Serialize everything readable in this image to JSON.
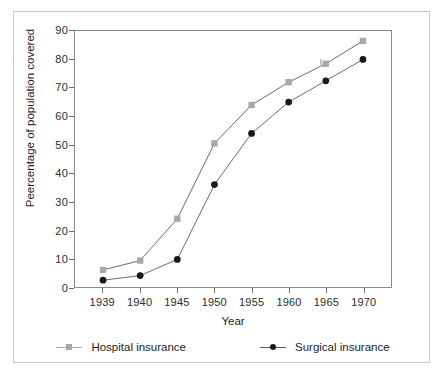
{
  "chart_data": {
    "type": "line",
    "title": "",
    "xlabel": "Year",
    "ylabel": "Peercentage of population covered",
    "x": [
      1939,
      1940,
      1945,
      1950,
      1955,
      1960,
      1965,
      1970
    ],
    "categories": [
      "1939",
      "1940",
      "1945",
      "1950",
      "1955",
      "1960",
      "1965",
      "1970"
    ],
    "xtick_labels": [
      "1939",
      "1940",
      "1945",
      "1950",
      "1955",
      "1960",
      "1965",
      "1970"
    ],
    "ytick_labels": [
      "0",
      "10",
      "20",
      "30",
      "40",
      "50",
      "60",
      "70",
      "80",
      "90"
    ],
    "yticks": [
      0,
      10,
      20,
      30,
      40,
      50,
      60,
      70,
      80,
      90
    ],
    "ylim": [
      0,
      90
    ],
    "grid": false,
    "legend_position": "bottom",
    "series": [
      {
        "name": "Hospital insurance",
        "color": "#a8a8a8",
        "marker": "square",
        "values": [
          6,
          9.3,
          24,
          50.5,
          64,
          72,
          78.5,
          86.5
        ]
      },
      {
        "name": "Surgical insurance",
        "color": "#1a1a1a",
        "marker": "circle",
        "values": [
          2.4,
          4,
          9.7,
          36,
          54,
          65,
          72.5,
          80
        ]
      }
    ]
  },
  "legend": {
    "entries": [
      {
        "label": "Hospital insurance"
      },
      {
        "label": "Surgical insurance"
      }
    ]
  },
  "colors": {
    "hospital": "#a8a8a8",
    "surgical": "#1a1a1a",
    "line": "#6b6b6b",
    "axis": "#8a8a8a",
    "frame": "#c9c9c9",
    "text": "#1e1e1e",
    "background": "#ffffff"
  }
}
